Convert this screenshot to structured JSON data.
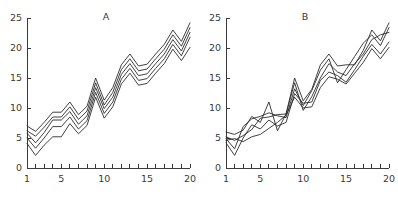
{
  "figure": {
    "background_color": "#ffffff",
    "line_color": "#2b2b2b",
    "axis_color": "#3a3a3a"
  },
  "chart_data": [
    {
      "type": "line",
      "panel_id": "A",
      "title": "A",
      "xlabel": "",
      "ylabel": "",
      "xlim": [
        1,
        20
      ],
      "ylim": [
        0,
        25
      ],
      "grid": false,
      "legend": "none",
      "x": [
        1,
        2,
        3,
        4,
        5,
        6,
        7,
        8,
        9,
        10,
        11,
        12,
        13,
        14,
        15,
        16,
        17,
        18,
        19,
        20
      ],
      "xticks": [
        1,
        2,
        3,
        4,
        5,
        6,
        7,
        8,
        9,
        10,
        11,
        12,
        13,
        14,
        15,
        16,
        17,
        18,
        19,
        20
      ],
      "xtick_labels_shown": [
        1,
        5,
        10,
        15,
        20
      ],
      "yticks": [
        0,
        5,
        10,
        15,
        20,
        25
      ],
      "ytick_labels_shown": [
        0,
        5,
        10,
        15,
        20,
        25
      ],
      "series": [
        {
          "name": "line-1",
          "values": [
            7.0,
            6.1,
            7.6,
            9.3,
            9.3,
            11.0,
            8.9,
            10.3,
            15.0,
            11.3,
            13.4,
            17.2,
            19.0,
            17.0,
            17.3,
            19.0,
            20.6,
            23.0,
            21.1,
            24.2
          ]
        },
        {
          "name": "line-2",
          "values": [
            6.2,
            5.3,
            6.8,
            8.5,
            8.5,
            10.2,
            8.1,
            9.5,
            14.2,
            10.5,
            12.6,
            16.4,
            18.2,
            16.2,
            16.5,
            18.2,
            19.8,
            22.2,
            20.3,
            23.4
          ]
        },
        {
          "name": "line-3",
          "values": [
            5.8,
            4.2,
            5.9,
            8.0,
            8.0,
            9.4,
            7.3,
            8.7,
            13.4,
            9.9,
            11.8,
            15.6,
            17.4,
            15.4,
            15.7,
            17.4,
            19.0,
            21.4,
            19.5,
            22.6
          ]
        },
        {
          "name": "line-4",
          "values": [
            5.0,
            3.3,
            5.0,
            6.9,
            6.9,
            8.5,
            6.5,
            7.9,
            12.6,
            9.1,
            11.0,
            14.8,
            16.6,
            14.6,
            14.9,
            16.6,
            18.2,
            20.6,
            18.7,
            21.8
          ]
        },
        {
          "name": "line-5",
          "values": [
            4.1,
            2.1,
            3.8,
            5.2,
            5.2,
            7.4,
            5.7,
            7.1,
            11.8,
            8.3,
            10.2,
            14.0,
            15.8,
            13.8,
            14.1,
            15.8,
            17.4,
            19.8,
            17.9,
            20.1
          ]
        }
      ]
    },
    {
      "type": "line",
      "panel_id": "B",
      "title": "B",
      "xlabel": "",
      "ylabel": "",
      "xlim": [
        1,
        20
      ],
      "ylim": [
        0,
        25
      ],
      "grid": false,
      "legend": "none",
      "x": [
        1,
        2,
        3,
        4,
        5,
        6,
        7,
        8,
        9,
        10,
        11,
        12,
        13,
        14,
        15,
        16,
        17,
        18,
        19,
        20
      ],
      "xticks": [
        1,
        2,
        3,
        4,
        5,
        6,
        7,
        8,
        9,
        10,
        11,
        12,
        13,
        14,
        15,
        16,
        17,
        18,
        19,
        20
      ],
      "xtick_labels_shown": [
        1,
        5,
        10,
        15,
        20
      ],
      "yticks": [
        0,
        5,
        10,
        15,
        20,
        25
      ],
      "ytick_labels_shown": [
        0,
        5,
        10,
        15,
        20,
        25
      ],
      "series": [
        {
          "name": "line-1",
          "values": [
            6.0,
            5.6,
            6.3,
            8.6,
            7.6,
            11.0,
            6.2,
            9.0,
            15.0,
            11.2,
            13.1,
            17.2,
            19.0,
            17.0,
            17.2,
            17.2,
            19.6,
            23.0,
            21.2,
            24.2
          ]
        },
        {
          "name": "line-2",
          "values": [
            4.9,
            3.2,
            6.9,
            8.2,
            8.6,
            9.2,
            8.7,
            8.4,
            13.2,
            10.4,
            12.9,
            16.3,
            18.2,
            14.2,
            16.4,
            18.6,
            20.8,
            22.2,
            20.4,
            23.4
          ]
        },
        {
          "name": "line-3",
          "values": [
            5.2,
            4.6,
            5.4,
            6.4,
            8.3,
            8.5,
            8.9,
            9.0,
            14.2,
            9.6,
            11.9,
            15.0,
            17.4,
            16.0,
            15.4,
            17.4,
            19.0,
            21.4,
            22.2,
            22.6
          ]
        },
        {
          "name": "line-4",
          "values": [
            4.2,
            2.1,
            5.0,
            7.2,
            6.5,
            8.0,
            7.0,
            7.6,
            12.4,
            10.8,
            11.0,
            14.6,
            16.0,
            15.4,
            14.3,
            16.4,
            18.6,
            20.6,
            19.0,
            21.0
          ]
        },
        {
          "name": "line-5",
          "values": [
            4.6,
            4.9,
            4.4,
            5.2,
            5.6,
            6.6,
            7.6,
            8.8,
            11.8,
            10.0,
            10.2,
            13.4,
            15.2,
            14.8,
            14.0,
            15.8,
            17.6,
            19.9,
            18.2,
            20.1
          ]
        }
      ]
    }
  ]
}
